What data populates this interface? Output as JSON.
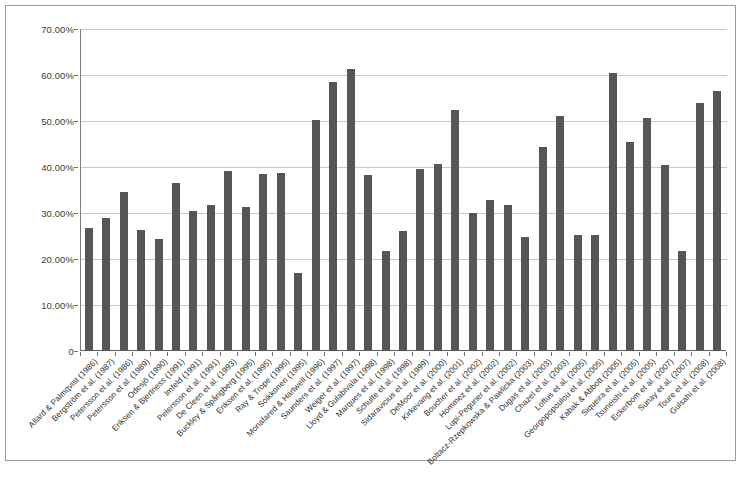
{
  "figure": {
    "background_color": "#ffffff",
    "border_color": "#9a9a9a",
    "bar_color": "#565656",
    "gridline_color": "#c8c8c8",
    "axis_color": "#6f6f6f"
  },
  "chart_data": {
    "type": "bar",
    "title": "",
    "subtitle": "",
    "xlabel": "",
    "ylabel": "",
    "ylim": [
      0,
      70
    ],
    "grid": true,
    "legend": false,
    "y_tick_labels": [
      "70.00%",
      "60.00%",
      "50.00%",
      "40.00%",
      "30.00%",
      "20.00%",
      "10.00%",
      "0"
    ],
    "y_tick_values": [
      70,
      60,
      50,
      40,
      30,
      20,
      10,
      0
    ],
    "categories": [
      "Allard & Palmqvist (1986)",
      "Bergström et al. (1987)",
      "Petersson et al. (1986)",
      "Petersson et al. (1989)",
      "Odesjö (1990)",
      "Eriksen & Bjertness (1991)",
      "Imfeld (1991)",
      "Petersson et al. (1991)",
      "De Cleen et al. (1993)",
      "Buckley & Spångberg (1995)",
      "Eriksen et al. (1995)",
      "Ray & Trope (1995)",
      "Soikkonen (1995)",
      "Monafared & Hartwell (1996)",
      "Saunders et al. (1997)",
      "Weiger et al. (1997)",
      "Lloyd & Gulabivala (1998)",
      "Marques et al. (1998)",
      "Schulte et al. (1998)",
      "Sidaravicius et al. (1999)",
      "DeMoor et al. (2000)",
      "Kirkevang et al. (2001)",
      "Boucher et al. (2002)",
      "Hommez et al. (2002)",
      "Lupi-Pegurier et al. (2002)",
      "Boltacz-Rzepkowska & Pawlicka (2003)",
      "Dugas et al. (2003)",
      "Chazel et al. (2003)",
      "Loftus et al. (2005)",
      "Georgopopoulou et al. (2005)",
      "Kabak & Abbott (2005)",
      "Siqueira et al. (2005)",
      "Tsuneishi et al. (2005)",
      "Eckerbom et al. (2007)",
      "Sunay et al. (2007)",
      "Toure et al. (2008)",
      "Gulsahi et al. (2008)"
    ],
    "values": [
      26.8,
      28.9,
      34.6,
      26.4,
      24.3,
      36.6,
      30.4,
      31.8,
      39.2,
      31.4,
      38.5,
      38.8,
      16.9,
      50.3,
      58.5,
      61.3,
      38.2,
      21.8,
      26.1,
      39.6,
      40.6,
      52.4,
      29.9,
      32.8,
      31.7,
      24.7,
      44.4,
      51.0,
      25.3,
      25.3,
      60.4,
      45.4,
      50.6,
      40.4,
      21.7,
      53.9,
      56.6
    ],
    "units": "%"
  }
}
